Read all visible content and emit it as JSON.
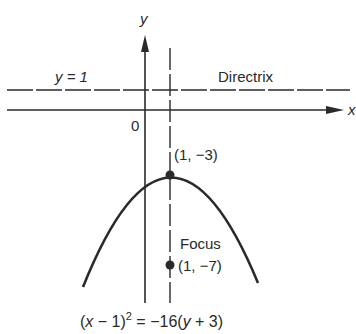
{
  "diagram": {
    "type": "parabola",
    "axes": {
      "x_label": "x",
      "y_label": "y",
      "origin_label": "0"
    },
    "directrix": {
      "equation_label": "y = 1",
      "name_label": "Directrix"
    },
    "vertex": {
      "label": "(1, −3)",
      "x": 1,
      "y": -3
    },
    "focus": {
      "name_label": "Focus",
      "coord_label": "(1, −7)",
      "x": 1,
      "y": -7
    },
    "equation": {
      "lhs_open": "(",
      "lhs_var": "x",
      "lhs_rest": " − 1)",
      "exponent": "2",
      "rhs_pre": " = −16(",
      "rhs_var": "y",
      "rhs_post": " + 3)"
    },
    "colors": {
      "ink": "#2a2a2a",
      "background": "#ffffff"
    }
  }
}
